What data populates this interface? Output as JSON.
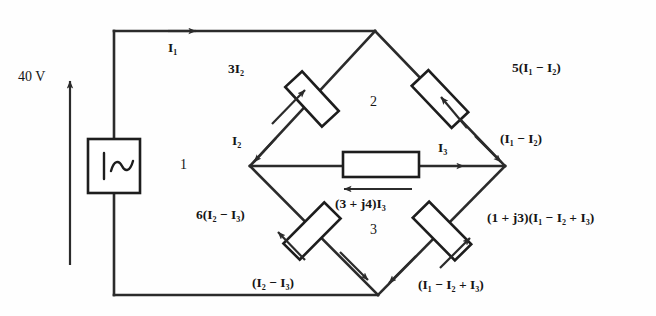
{
  "diagram": {
    "source": {
      "voltage_label": "40 V",
      "symbol": "ac-voltage-source-icon"
    },
    "loops": [
      {
        "id": "loop-1",
        "label": "1"
      },
      {
        "id": "loop-2",
        "label": "2"
      },
      {
        "id": "loop-3",
        "label": "3"
      }
    ],
    "branch_currents": {
      "top_wire": "I₁",
      "upper_left": "I₂",
      "upper_right": "(I₁ − I₂)",
      "middle": "I₃",
      "lower_left": "(I₂ − I₃)",
      "lower_right": "(I₁ − I₂ + I₃)"
    },
    "resistor_drops": {
      "upper_left": "3I₂",
      "upper_right": "5(I₁ − I₂)",
      "middle": "(3 + j4)I₃",
      "lower_left": "6(I₂ − I₃)",
      "lower_right": "(1 + j3)(I₁ − I₂ + I₃)"
    },
    "colors": {
      "ink": "#2b2b2b",
      "paper": "#fefefe"
    }
  }
}
